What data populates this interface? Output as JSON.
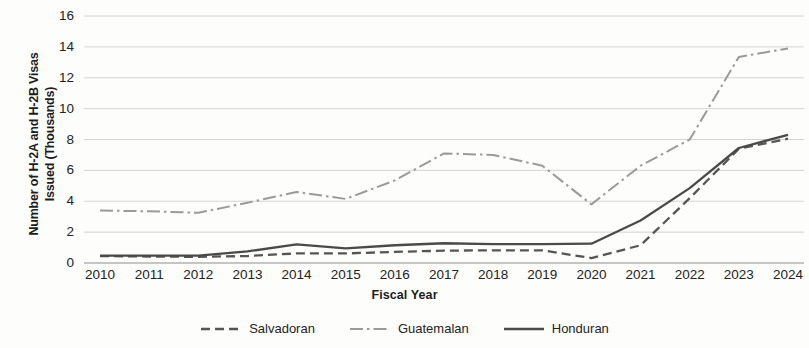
{
  "chart_data": {
    "type": "line",
    "title": "",
    "xlabel": "Fiscal Year",
    "ylabel": "Number of H-2A and H-2B Visas Issued (Thousands)",
    "ylabel_line1": "Number of H-2A and H-2B Visas",
    "ylabel_line2": "Issued (Thousands)",
    "categories": [
      "2010",
      "2011",
      "2012",
      "2013",
      "2014",
      "2015",
      "2016",
      "2017",
      "2018",
      "2019",
      "2020",
      "2021",
      "2022",
      "2023",
      "2024"
    ],
    "x": [
      2010,
      2011,
      2012,
      2013,
      2014,
      2015,
      2016,
      2017,
      2018,
      2019,
      2020,
      2021,
      2022,
      2023,
      2024
    ],
    "ylim": [
      0,
      16
    ],
    "ytick_values": [
      0,
      2,
      4,
      6,
      8,
      10,
      12,
      14,
      16
    ],
    "ytick_labels": [
      "0",
      "2",
      "4",
      "6",
      "8",
      "10",
      "12",
      "14",
      "16"
    ],
    "grid": true,
    "grid_axis": "y",
    "legend_position": "bottom",
    "series": [
      {
        "name": "Salvadoran",
        "style": "dashed",
        "color": "#555555",
        "values": [
          0.45,
          0.42,
          0.4,
          0.45,
          0.62,
          0.62,
          0.72,
          0.8,
          0.82,
          0.82,
          0.32,
          1.15,
          4.2,
          7.4,
          8.05
        ]
      },
      {
        "name": "Guatemalan",
        "style": "dash-dot",
        "color": "#9a9a9a",
        "values": [
          3.4,
          3.35,
          3.25,
          3.9,
          4.6,
          4.15,
          5.35,
          7.1,
          7.0,
          6.3,
          3.8,
          6.3,
          8.0,
          13.35,
          13.9
        ]
      },
      {
        "name": "Honduran",
        "style": "solid",
        "color": "#4a4a4a",
        "values": [
          0.48,
          0.48,
          0.48,
          0.75,
          1.2,
          0.95,
          1.15,
          1.28,
          1.22,
          1.22,
          1.25,
          2.75,
          4.85,
          7.45,
          8.3
        ]
      }
    ]
  },
  "legend": {
    "items": [
      {
        "label": "Salvadoran",
        "icon": "dashed-line-icon"
      },
      {
        "label": "Guatemalan",
        "icon": "dash-dot-line-icon"
      },
      {
        "label": "Honduran",
        "icon": "solid-line-icon"
      }
    ]
  }
}
